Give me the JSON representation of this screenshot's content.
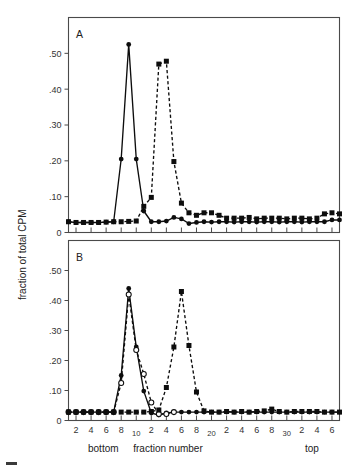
{
  "figure": {
    "panel_a_label": "A",
    "panel_b_label": "B",
    "y_axis_title": "fraction of total CPM",
    "x_axis_title": "fraction number",
    "x_left_label": "bottom",
    "x_right_label": "top"
  },
  "chart_data": [
    {
      "type": "line",
      "title": "A",
      "xlabel": "fraction number",
      "ylabel": "fraction of total CPM",
      "xlim": [
        1,
        37
      ],
      "ylim": [
        0,
        0.6
      ],
      "grid": false,
      "legend": "none",
      "x_tick_labels": [
        "2",
        "4",
        "6",
        "8",
        "10",
        "2",
        "4",
        "6",
        "8",
        "20",
        "2",
        "4",
        "6",
        "8",
        "30",
        "2",
        "4",
        "6"
      ],
      "x_tick_values": [
        2,
        4,
        6,
        8,
        10,
        12,
        14,
        16,
        18,
        20,
        22,
        24,
        26,
        28,
        30,
        32,
        34,
        36
      ],
      "y_tick_labels": [
        "0",
        ".10",
        ".20",
        ".30",
        ".40",
        ".50"
      ],
      "y_tick_values": [
        0,
        0.1,
        0.2,
        0.3,
        0.4,
        0.5
      ],
      "x_left_annotation": "bottom",
      "x_right_annotation": "top",
      "series": [
        {
          "name": "solid-circle",
          "marker": "filled-circle",
          "line": "solid",
          "x": [
            1,
            2,
            3,
            4,
            5,
            6,
            7,
            8,
            9,
            10,
            11,
            12,
            13,
            14,
            15,
            16,
            17,
            18,
            19,
            20,
            21,
            22,
            23,
            24,
            25,
            26,
            27,
            28,
            29,
            30,
            31,
            32,
            33,
            34,
            35,
            36,
            37
          ],
          "values": [
            0.03,
            0.028,
            0.028,
            0.028,
            0.028,
            0.029,
            0.03,
            0.205,
            0.525,
            0.205,
            0.06,
            0.03,
            0.03,
            0.032,
            0.042,
            0.038,
            0.025,
            0.028,
            0.03,
            0.029,
            0.03,
            0.03,
            0.029,
            0.03,
            0.03,
            0.029,
            0.03,
            0.03,
            0.029,
            0.03,
            0.03,
            0.029,
            0.03,
            0.03,
            0.03,
            0.035,
            0.035
          ]
        },
        {
          "name": "dashed-square",
          "marker": "filled-square",
          "line": "dashed",
          "x": [
            1,
            2,
            3,
            4,
            5,
            6,
            7,
            8,
            9,
            10,
            11,
            12,
            13,
            14,
            15,
            16,
            17,
            18,
            19,
            20,
            21,
            22,
            23,
            24,
            25,
            26,
            27,
            28,
            29,
            30,
            31,
            32,
            33,
            34,
            35,
            36,
            37
          ],
          "values": [
            0.03,
            0.028,
            0.028,
            0.028,
            0.028,
            0.029,
            0.03,
            0.03,
            0.031,
            0.032,
            0.073,
            0.098,
            0.47,
            0.478,
            0.198,
            0.082,
            0.055,
            0.048,
            0.055,
            0.055,
            0.048,
            0.04,
            0.04,
            0.04,
            0.042,
            0.038,
            0.04,
            0.04,
            0.04,
            0.038,
            0.04,
            0.04,
            0.038,
            0.04,
            0.052,
            0.055,
            0.052
          ]
        }
      ]
    },
    {
      "type": "line",
      "title": "B",
      "xlabel": "fraction number",
      "ylabel": "fraction of total CPM",
      "xlim": [
        1,
        37
      ],
      "ylim": [
        0,
        0.6
      ],
      "grid": false,
      "legend": "none",
      "x_tick_labels": [
        "2",
        "4",
        "6",
        "8",
        "10",
        "2",
        "4",
        "6",
        "8",
        "20",
        "2",
        "4",
        "6",
        "8",
        "30",
        "2",
        "4",
        "6"
      ],
      "x_tick_values": [
        2,
        4,
        6,
        8,
        10,
        12,
        14,
        16,
        18,
        20,
        22,
        24,
        26,
        28,
        30,
        32,
        34,
        36
      ],
      "y_tick_labels": [
        "0",
        ".10",
        ".20",
        ".30",
        ".40",
        ".50"
      ],
      "y_tick_values": [
        0,
        0.1,
        0.2,
        0.3,
        0.4,
        0.5
      ],
      "x_left_annotation": "bottom",
      "x_right_annotation": "top",
      "series": [
        {
          "name": "solid-circle",
          "marker": "filled-circle",
          "line": "solid",
          "x": [
            1,
            2,
            3,
            4,
            5,
            6,
            7,
            8,
            9,
            10,
            11,
            12,
            13,
            14,
            15,
            16,
            17,
            18,
            19,
            20,
            21,
            22,
            23,
            24,
            25,
            26,
            27,
            28,
            29,
            30,
            31,
            32,
            33,
            34,
            35,
            36,
            37
          ],
          "values": [
            0.028,
            0.028,
            0.028,
            0.028,
            0.028,
            0.028,
            0.028,
            0.15,
            0.44,
            0.245,
            0.098,
            0.025,
            0.018,
            0.025,
            0.028,
            0.028,
            0.028,
            0.028,
            0.028,
            0.028,
            0.028,
            0.028,
            0.028,
            0.028,
            0.028,
            0.028,
            0.028,
            0.028,
            0.028,
            0.028,
            0.028,
            0.028,
            0.028,
            0.028,
            0.028,
            0.028,
            0.028
          ]
        },
        {
          "name": "open-circle",
          "marker": "open-circle",
          "line": "dashed",
          "x": [
            1,
            2,
            3,
            4,
            5,
            6,
            7,
            8,
            9,
            10,
            11,
            12,
            13,
            14,
            15
          ],
          "values": [
            0.028,
            0.028,
            0.028,
            0.028,
            0.028,
            0.028,
            0.028,
            0.125,
            0.42,
            0.235,
            0.155,
            0.06,
            0.022,
            0.022,
            0.028
          ]
        },
        {
          "name": "dashed-square",
          "marker": "filled-square",
          "line": "dashed",
          "x": [
            1,
            2,
            3,
            4,
            5,
            6,
            7,
            8,
            9,
            10,
            11,
            12,
            13,
            14,
            15,
            16,
            17,
            18,
            19,
            20,
            21,
            22,
            23,
            24,
            25,
            26,
            27,
            28,
            29,
            30,
            31,
            32,
            33,
            34,
            35,
            36,
            37
          ],
          "values": [
            0.028,
            0.028,
            0.028,
            0.028,
            0.028,
            0.028,
            0.028,
            0.028,
            0.028,
            0.028,
            0.028,
            0.03,
            0.035,
            0.11,
            0.245,
            0.43,
            0.25,
            0.095,
            0.032,
            0.028,
            0.028,
            0.03,
            0.028,
            0.03,
            0.028,
            0.03,
            0.032,
            0.038,
            0.03,
            0.028,
            0.03,
            0.03,
            0.03,
            0.03,
            0.028,
            0.028,
            0.028
          ]
        }
      ]
    }
  ]
}
